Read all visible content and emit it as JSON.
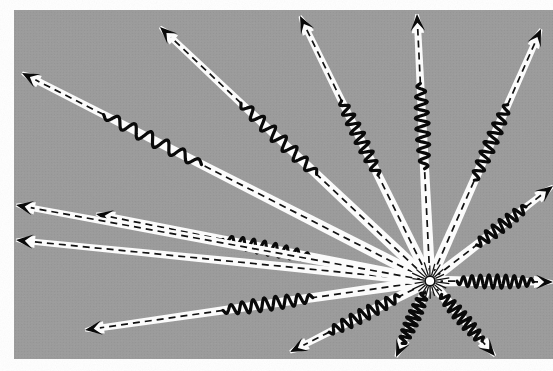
{
  "figure": {
    "caption": "",
    "domain_type": "scientific-illustration",
    "media": "halftone print scan"
  },
  "canvas": {
    "width": 553,
    "height": 371,
    "page_background": "#ffffff",
    "panel_background": "#9a9a9a",
    "panel_x": 14,
    "panel_y": 10,
    "panel_width": 539,
    "panel_height": 349,
    "halftone_dot_color": "#8d8d8d",
    "halftone_highlight": "#a6a6a6"
  },
  "style": {
    "beam_fill": "#fbfbfb",
    "beam_stroke": "none",
    "centerline_color": "#111111",
    "centerline_width": 1.7,
    "centerline_dash": "7 5",
    "wave_color": "#0a0a0a",
    "wave_width": 3.2,
    "arrowhead_color": "#0a0a0a",
    "source_glow_color": "#ffffff",
    "source_spike_color": "#111111"
  },
  "source": {
    "label": "point source",
    "x": 430,
    "y": 281,
    "core_radius": 5.0,
    "spike_count": 22,
    "spike_inner": 6,
    "spike_outer": 17
  },
  "chart_data": {
    "type": "scatter",
    "xlabel": "",
    "ylabel": "",
    "origin": [
      430,
      281
    ],
    "ray_count": 14,
    "rays": [
      {
        "id": "ray-w-upper",
        "angle_deg": 201.0,
        "tip_x": 22,
        "tip_y": 73,
        "half_width_base": 5.6,
        "half_width_tip": 3.4,
        "wave_start_frac": 0.56,
        "wave_end_frac": 0.8,
        "wave_cycles": 6,
        "wave_amp": 6.5
      },
      {
        "id": "ray-wnw",
        "angle_deg": 212.5,
        "tip_x": 160,
        "tip_y": 27,
        "half_width_base": 5.4,
        "half_width_tip": 3.2,
        "wave_start_frac": 0.42,
        "wave_end_frac": 0.7,
        "wave_cycles": 7,
        "wave_amp": 6.8
      },
      {
        "id": "ray-nnw-outer",
        "angle_deg": 232.0,
        "tip_x": 300,
        "tip_y": 16,
        "half_width_base": 5.2,
        "half_width_tip": 3.2,
        "wave_start_frac": 0.4,
        "wave_end_frac": 0.68,
        "wave_cycles": 8,
        "wave_amp": 6.5
      },
      {
        "id": "ray-n",
        "angle_deg": 268.0,
        "tip_x": 417,
        "tip_y": 14,
        "half_width_base": 5.4,
        "half_width_tip": 3.4,
        "wave_start_frac": 0.42,
        "wave_end_frac": 0.74,
        "wave_cycles": 8,
        "wave_amp": 6.8
      },
      {
        "id": "ray-nne",
        "angle_deg": 300.0,
        "tip_x": 541,
        "tip_y": 29,
        "half_width_base": 5.3,
        "half_width_tip": 3.3,
        "wave_start_frac": 0.4,
        "wave_end_frac": 0.7,
        "wave_cycles": 8,
        "wave_amp": 6.6
      },
      {
        "id": "ray-ene",
        "angle_deg": 330.5,
        "tip_x": 553,
        "tip_y": 186,
        "half_width_base": 5.2,
        "half_width_tip": 3.2,
        "wave_start_frac": 0.38,
        "wave_end_frac": 0.78,
        "wave_cycles": 7,
        "wave_amp": 6.4
      },
      {
        "id": "ray-e",
        "angle_deg": 0.5,
        "tip_x": 553,
        "tip_y": 282,
        "half_width_base": 5.4,
        "half_width_tip": 3.4,
        "wave_start_frac": 0.22,
        "wave_end_frac": 0.84,
        "wave_cycles": 9,
        "wave_amp": 6.6
      },
      {
        "id": "ray-sse",
        "angle_deg": 58.0,
        "tip_x": 495,
        "tip_y": 356,
        "half_width_base": 5.3,
        "half_width_tip": 3.3,
        "wave_start_frac": 0.18,
        "wave_end_frac": 0.8,
        "wave_cycles": 8,
        "wave_amp": 6.8
      },
      {
        "id": "ray-ssw",
        "angle_deg": 116.0,
        "tip_x": 396,
        "tip_y": 357,
        "half_width_base": 5.3,
        "half_width_tip": 3.3,
        "wave_start_frac": 0.16,
        "wave_end_frac": 0.82,
        "wave_cycles": 8,
        "wave_amp": 6.6
      },
      {
        "id": "ray-sw",
        "angle_deg": 143.0,
        "tip_x": 290,
        "tip_y": 352,
        "half_width_base": 5.2,
        "half_width_tip": 3.2,
        "wave_start_frac": 0.22,
        "wave_end_frac": 0.72,
        "wave_cycles": 8,
        "wave_amp": 6.5
      },
      {
        "id": "ray-wsw-lower",
        "angle_deg": 160.5,
        "tip_x": 85,
        "tip_y": 330,
        "half_width_base": 5.4,
        "half_width_tip": 3.3,
        "wave_start_frac": 0.34,
        "wave_end_frac": 0.6,
        "wave_cycles": 8,
        "wave_amp": 6.6
      },
      {
        "id": "ray-wsw",
        "angle_deg": 168.5,
        "tip_x": 96,
        "tip_y": 214,
        "half_width_base": 5.4,
        "half_width_tip": 3.3,
        "wave_start_frac": 0.36,
        "wave_end_frac": 0.62,
        "wave_cycles": 8,
        "wave_amp": 6.6
      },
      {
        "id": "ray-w-edge",
        "angle_deg": 184.0,
        "tip_x": 16,
        "tip_y": 240,
        "half_width_base": 5.0,
        "half_width_tip": 3.0,
        "wave_start_frac": 0.0,
        "wave_end_frac": 0.0,
        "wave_cycles": 0,
        "wave_amp": 0
      },
      {
        "id": "ray-wnw-edge",
        "angle_deg": 191.0,
        "tip_x": 16,
        "tip_y": 205,
        "half_width_base": 4.8,
        "half_width_tip": 3.0,
        "wave_start_frac": 0.0,
        "wave_end_frac": 0.0,
        "wave_cycles": 0,
        "wave_amp": 0
      }
    ]
  }
}
